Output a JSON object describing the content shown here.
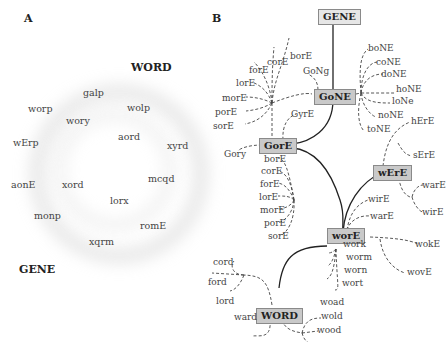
{
  "panel_a": {
    "label": "A",
    "target_top": "WORD",
    "target_bottom": "GENE",
    "words": [
      "galp",
      "worp",
      "wolp",
      "wory",
      "aord",
      "wErp",
      "xyrd",
      "aonE",
      "xord",
      "mcqd",
      "lorx",
      "monp",
      "romE",
      "xqrm"
    ]
  },
  "panel_b": {
    "label": "B",
    "nodes": {
      "gene": "GENE",
      "gone": "GoNE",
      "gore": "GorE",
      "were": "wErE",
      "wore": "worE",
      "word": "WORD"
    },
    "leaves": {
      "gone_top": [
        "borE",
        "corE",
        "forE",
        "lorE",
        "morE",
        "porE",
        "sorE"
      ],
      "gone_side": "GoNg",
      "gone_right": [
        "boNE",
        "coNE",
        "doNE",
        "hoNE",
        "loNe",
        "noNE",
        "toNE"
      ],
      "gore_top": "GyrE",
      "gore_left": "Gory",
      "gore_below": [
        "borE",
        "corE",
        "forE",
        "lorE",
        "morE",
        "porE",
        "sorE"
      ],
      "were_right": [
        "hErE",
        "sErE",
        "warE",
        "wirE"
      ],
      "wore_up": [
        "wirE",
        "warE"
      ],
      "wore_right": [
        "wokE",
        "wovE"
      ],
      "wore_below": [
        "work",
        "worm",
        "worn",
        "wort"
      ],
      "word_left": [
        "cord",
        "ford",
        "lord"
      ],
      "word_bottom_left": "ward",
      "word_bottom_right": [
        "woad",
        "wold",
        "wood"
      ]
    }
  }
}
